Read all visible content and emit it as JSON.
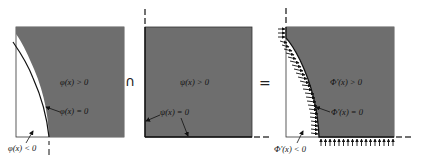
{
  "colors": {
    "region_fill": "#6e6e6e",
    "outline": "#222222",
    "background": "#ffffff"
  },
  "panels": [
    {
      "name": "phi-panel",
      "labels": {
        "positive": "φ(x) > 0",
        "zero": "φ(x) = 0",
        "negative": "φ(x) < 0"
      }
    },
    {
      "name": "psi-panel",
      "labels": {
        "positive": "ψ(x) > 0",
        "zero": "ψ(x) = 0"
      }
    },
    {
      "name": "Phi-prime-panel",
      "labels": {
        "positive": "Φ'(x) > 0",
        "zero": "Φ'(x) = 0",
        "negative": "Φ'(x) < 0"
      }
    }
  ],
  "operators": {
    "intersection": "∩",
    "equals": "="
  }
}
